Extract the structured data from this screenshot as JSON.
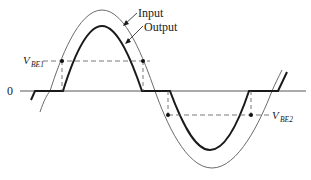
{
  "diagram": {
    "title": "",
    "axis": {
      "zero_label": "0"
    },
    "labels": {
      "input": "Input",
      "output": "Output",
      "vbe1_main": "V",
      "vbe1_sub": "BE1",
      "vbe2_main": "V",
      "vbe2_sub": "BE2"
    },
    "series": [
      {
        "name": "Input",
        "style": "thin",
        "color": "#6b6b6b"
      },
      {
        "name": "Output",
        "style": "thick",
        "color": "#1a1a1a"
      }
    ],
    "colors": {
      "input_line": "#6b6b6b",
      "output_line": "#1a1a1a",
      "axis": "#444444",
      "dashed": "#555555",
      "background": "#ffffff"
    }
  }
}
